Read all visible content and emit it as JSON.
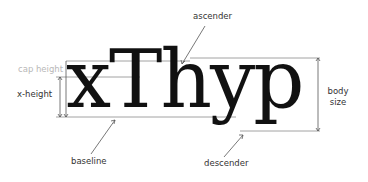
{
  "diagram": {
    "sample_text": "xThyp",
    "labels": {
      "ascender": "ascender",
      "cap_height": "cap height",
      "x_height": "x-height",
      "baseline": "baseline",
      "descender": "descender",
      "body_size_line1": "body",
      "body_size_line2": "size"
    },
    "guide_lines": {
      "ascender_y": 58,
      "cap_height_y": 61,
      "x_height_y": 77,
      "baseline_y": 117,
      "descender_y": 131
    },
    "colors": {
      "text": "#111111",
      "guide": "#8a8a8a",
      "label": "#333333"
    }
  }
}
